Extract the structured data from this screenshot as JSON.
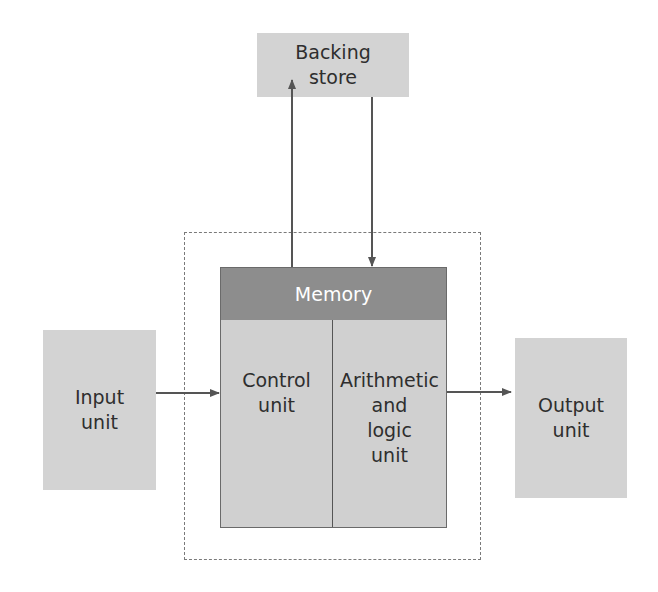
{
  "diagram": {
    "backing_store": "Backing\nstore",
    "memory": "Memory",
    "control_unit": "Control\nunit",
    "alu": "Arithmetic\nand\nlogic\nunit",
    "input_unit": "Input\nunit",
    "output_unit": "Output\nunit"
  },
  "colors": {
    "box_fill": "#d3d3d3",
    "memory_fill": "#8d8d8d",
    "arrow": "#555555",
    "dashed_border": "#7a7a7a"
  }
}
